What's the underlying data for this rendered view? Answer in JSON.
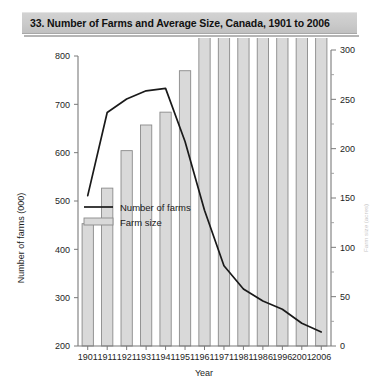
{
  "banner": {
    "title": "33. Number of Farms and Average Size, Canada, 1901 to 2006"
  },
  "chart_data": {
    "type": "bar",
    "title": "33. Number of Farms and Average Size, Canada, 1901 to 2006",
    "categories": [
      "1901",
      "1911",
      "1921",
      "1931",
      "1941",
      "1951",
      "1961",
      "1971",
      "1981",
      "1986",
      "1996",
      "2001",
      "2006"
    ],
    "xlabel": "Year",
    "ylabel": "Number of farms (000)",
    "y2label": "Farm size (acres)",
    "ylim": [
      200,
      800
    ],
    "yticks": [
      200,
      300,
      400,
      500,
      600,
      700,
      800
    ],
    "y2lim": [
      0,
      300
    ],
    "y2ticks": [
      0,
      50,
      100,
      150,
      200,
      250,
      300
    ],
    "y2minorticks": [
      25,
      75,
      125,
      175,
      225,
      275
    ],
    "grid": false,
    "legend_position": "center-left",
    "series": [
      {
        "name": "Number of farms",
        "type": "line",
        "axis": "left",
        "values": [
          511,
          683,
          711,
          728,
          733,
          623,
          481,
          366,
          318,
          293,
          276,
          247,
          229
        ]
      },
      {
        "name": "Farm size",
        "type": "bar",
        "axis": "right",
        "values": [
          124,
          160,
          198,
          224,
          237,
          279,
          359,
          463,
          507,
          573,
          608,
          676,
          728
        ]
      }
    ]
  },
  "legend": {
    "entries": [
      {
        "label": "Number of farms",
        "marker": "line"
      },
      {
        "label": "Farm size",
        "marker": "swatch"
      }
    ]
  }
}
